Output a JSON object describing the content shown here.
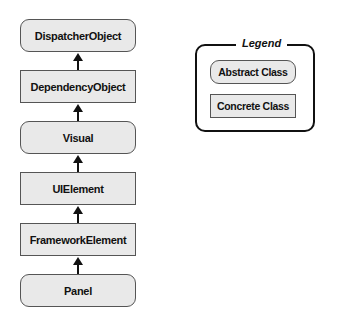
{
  "hierarchy": [
    {
      "label": "DispatcherObject",
      "kind": "abstract",
      "top": 19
    },
    {
      "label": "DependencyObject",
      "kind": "concrete",
      "top": 70
    },
    {
      "label": "Visual",
      "kind": "abstract",
      "top": 121
    },
    {
      "label": "UIElement",
      "kind": "concrete",
      "top": 172
    },
    {
      "label": "FrameworkElement",
      "kind": "concrete",
      "top": 223
    },
    {
      "label": "Panel",
      "kind": "abstract",
      "top": 274
    }
  ],
  "legend": {
    "title": "Legend",
    "items": [
      {
        "label": "Abstract Class",
        "kind": "abstract"
      },
      {
        "label": "Concrete Class",
        "kind": "concrete"
      }
    ]
  }
}
